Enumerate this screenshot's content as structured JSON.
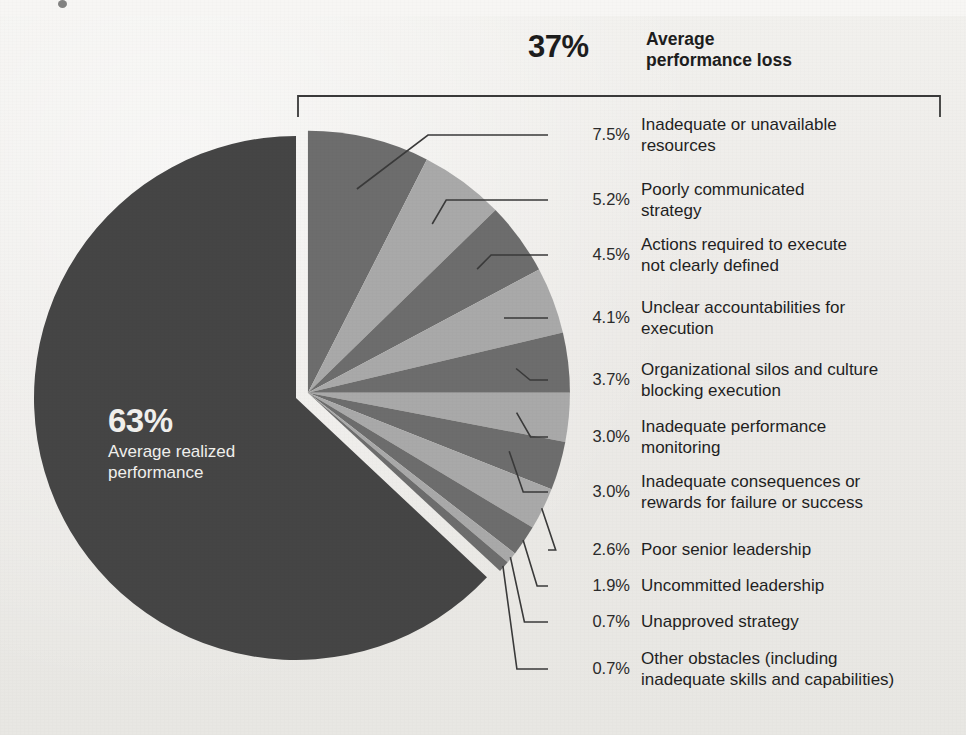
{
  "header": {
    "total_pct": "37%",
    "total_caption_line1": "Average",
    "total_caption_line2": "performance loss"
  },
  "center": {
    "pct": "63%",
    "caption_line1": "Average realized",
    "caption_line2": "performance"
  },
  "colors": {
    "background": "#edece9",
    "realized_slice": "#454545",
    "dark_slice": "#6d6d6d",
    "light_slice": "#a9a9a9",
    "leader_line": "#3a3a3a",
    "bracket": "#3a3a3a",
    "center_text": "#f0efec",
    "body_text": "#1f1f1f"
  },
  "chart_data": {
    "type": "pie",
    "title": "",
    "xlabel": "",
    "ylabel": "",
    "legend_position": "right",
    "grid": false,
    "unit": "%",
    "groups": [
      {
        "name": "Average realized performance",
        "value": 63.0
      },
      {
        "name": "Average performance loss",
        "value": 37.0
      }
    ],
    "categories": [
      "Average realized performance",
      "Inadequate or unavailable resources",
      "Poorly communicated strategy",
      "Actions required to execute not clearly defined",
      "Unclear accountabilities for execution",
      "Organizational silos and culture blocking execution",
      "Inadequate performance monitoring",
      "Inadequate consequences or rewards for failure or success",
      "Poor senior leadership",
      "Uncommitted leadership",
      "Unapproved strategy",
      "Other obstacles (including inadequate skills and capabilities)"
    ],
    "values": [
      63.0,
      7.5,
      5.2,
      4.5,
      4.1,
      3.7,
      3.0,
      3.0,
      2.6,
      1.9,
      0.7,
      0.7
    ]
  },
  "callouts": [
    {
      "pct": "7.5%",
      "value": 7.5,
      "text_line1": "Inadequate or unavailable",
      "text_line2": "resources",
      "shade": "dark"
    },
    {
      "pct": "5.2%",
      "value": 5.2,
      "text_line1": "Poorly communicated",
      "text_line2": "strategy",
      "shade": "light"
    },
    {
      "pct": "4.5%",
      "value": 4.5,
      "text_line1": "Actions required to execute",
      "text_line2": "not clearly defined",
      "shade": "dark"
    },
    {
      "pct": "4.1%",
      "value": 4.1,
      "text_line1": "Unclear accountabilities for",
      "text_line2": "execution",
      "shade": "light"
    },
    {
      "pct": "3.7%",
      "value": 3.7,
      "text_line1": "Organizational silos and culture",
      "text_line2": "blocking execution",
      "shade": "dark"
    },
    {
      "pct": "3.0%",
      "value": 3.0,
      "text_line1": "Inadequate performance",
      "text_line2": "monitoring",
      "shade": "light"
    },
    {
      "pct": "3.0%",
      "value": 3.0,
      "text_line1": "Inadequate consequences or",
      "text_line2": "rewards for failure or success",
      "shade": "dark"
    },
    {
      "pct": "2.6%",
      "value": 2.6,
      "text_line1": "Poor senior leadership",
      "text_line2": "",
      "shade": "light"
    },
    {
      "pct": "1.9%",
      "value": 1.9,
      "text_line1": "Uncommitted leadership",
      "text_line2": "",
      "shade": "dark"
    },
    {
      "pct": "0.7%",
      "value": 0.7,
      "text_line1": "Unapproved strategy",
      "text_line2": "",
      "shade": "light"
    },
    {
      "pct": "0.7%",
      "value": 0.7,
      "text_line1": "Other obstacles (including",
      "text_line2": "inadequate skills and capabilities)",
      "shade": "dark"
    }
  ]
}
